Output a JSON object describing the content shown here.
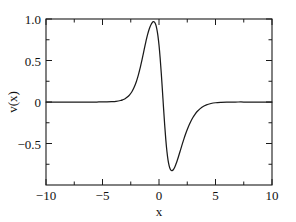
{
  "chart_data": {
    "type": "line",
    "title": "",
    "subtitle": "",
    "xlabel": "x",
    "ylabel": "v(x)",
    "xlim": [
      -10,
      10
    ],
    "ylim": [
      -1.0,
      1.0
    ],
    "grid": false,
    "legend": null,
    "legend_position": "none",
    "x_ticks": [
      -10,
      -5,
      0,
      5,
      10
    ],
    "x_tick_labels": [
      "−10",
      "−5",
      "0",
      "5",
      "10"
    ],
    "x_minor_ticks": [
      -7.5,
      -2.5,
      2.5,
      7.5
    ],
    "y_ticks": [
      -0.5,
      0,
      0.5,
      1.0
    ],
    "y_tick_labels": [
      "−0.5",
      "0",
      "0.5",
      "1.0"
    ],
    "y_minor_ticks": [
      -0.75,
      -0.25,
      0.25,
      0.75
    ],
    "series": [
      {
        "name": "v(x)",
        "color": "#1a1a1a",
        "line_width": 1.25,
        "x": [
          -10.0,
          -9.5,
          -9.0,
          -8.5,
          -8.0,
          -7.5,
          -7.0,
          -6.5,
          -6.0,
          -5.5,
          -5.0,
          -4.6,
          -4.2,
          -3.8,
          -3.4,
          -3.2,
          -3.0,
          -2.8,
          -2.6,
          -2.4,
          -2.2,
          -2.0,
          -1.9,
          -1.8,
          -1.7,
          -1.6,
          -1.5,
          -1.4,
          -1.3,
          -1.2,
          -1.1,
          -1.0,
          -0.9,
          -0.8,
          -0.7,
          -0.6,
          -0.5,
          -0.4,
          -0.3,
          -0.2,
          -0.1,
          0.0,
          0.1,
          0.2,
          0.3,
          0.4,
          0.5,
          0.6,
          0.7,
          0.8,
          0.9,
          1.0,
          1.1,
          1.2,
          1.3,
          1.4,
          1.5,
          1.6,
          1.7,
          1.8,
          1.9,
          2.0,
          2.2,
          2.4,
          2.6,
          2.8,
          3.0,
          3.2,
          3.4,
          3.8,
          4.2,
          4.6,
          5.0,
          5.5,
          6.0,
          6.5,
          7.0,
          7.5,
          8.0,
          8.5,
          9.0,
          9.5,
          10.0
        ],
        "y": [
          0.0,
          0.0,
          0.0,
          0.0,
          0.0,
          0.0,
          0.0,
          0.0,
          0.0,
          0.0,
          0.001,
          0.002,
          0.004,
          0.008,
          0.018,
          0.027,
          0.04,
          0.059,
          0.086,
          0.124,
          0.177,
          0.248,
          0.291,
          0.339,
          0.392,
          0.45,
          0.511,
          0.575,
          0.64,
          0.703,
          0.763,
          0.817,
          0.864,
          0.903,
          0.934,
          0.957,
          0.968,
          0.962,
          0.936,
          0.885,
          0.803,
          0.686,
          0.534,
          0.35,
          0.145,
          -0.068,
          -0.271,
          -0.45,
          -0.594,
          -0.7,
          -0.77,
          -0.81,
          -0.826,
          -0.824,
          -0.808,
          -0.782,
          -0.748,
          -0.71,
          -0.668,
          -0.624,
          -0.579,
          -0.534,
          -0.447,
          -0.368,
          -0.298,
          -0.238,
          -0.187,
          -0.145,
          -0.111,
          -0.063,
          -0.034,
          -0.018,
          -0.009,
          -0.004,
          -0.001,
          -0.001,
          0.0,
          0.0,
          0.0,
          0.0,
          0.0,
          0.0,
          0.0
        ],
        "peak": {
          "x": -0.55,
          "y": 0.97
        },
        "trough": {
          "x": 0.85,
          "y": -0.83
        }
      }
    ]
  },
  "axes": {
    "x_axis_label": "x",
    "y_axis_label": "v(x)"
  }
}
